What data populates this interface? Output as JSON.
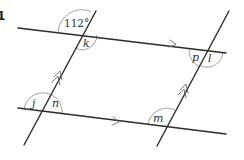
{
  "question_number": "1",
  "given_angle": {
    "label": "112°",
    "value_degrees": 112
  },
  "angle_labels": {
    "k": "k",
    "p": "p",
    "l": "l",
    "j": "j",
    "n": "n",
    "m": "m"
  },
  "colors": {
    "line": "#2b2b2b",
    "arc": "#8a8a8a",
    "text": "#333333",
    "background": "#ffffff"
  }
}
